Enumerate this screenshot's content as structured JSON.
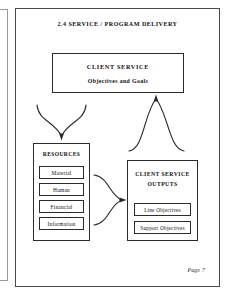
{
  "document": {
    "section_heading": "2.4   SERVICE / PROGRAM DELIVERY",
    "footer": "Page 7"
  },
  "diagram": {
    "type": "flow-diagram",
    "nodes": [
      {
        "id": "client-service",
        "title": "CLIENT SERVICE",
        "subtitle": "Objectives and Goals"
      },
      {
        "id": "resources",
        "title": "RESOURCES",
        "items": [
          "Material",
          "Human",
          "Financial",
          "Information"
        ]
      },
      {
        "id": "client-service-outputs",
        "title_line1": "CLIENT SERVICE",
        "title_line2": "OUTPUTS",
        "items": [
          "Line  Objectives",
          "Support   Objectives"
        ]
      }
    ],
    "connectors": [
      {
        "id": "objectives-to-resources",
        "from": "client-service",
        "to": "resources",
        "shape": "forked-curve",
        "direction": "down"
      },
      {
        "id": "resources-to-outputs",
        "from": "resources",
        "to": "client-service-outputs",
        "shape": "forked-curve",
        "direction": "right"
      },
      {
        "id": "outputs-to-objectives",
        "from": "client-service-outputs",
        "to": "client-service",
        "shape": "forked-curve",
        "direction": "up"
      }
    ]
  },
  "colors": {
    "ink": "#2b2b2b",
    "page": "#ffffff",
    "frame": "#4a4a4a"
  }
}
